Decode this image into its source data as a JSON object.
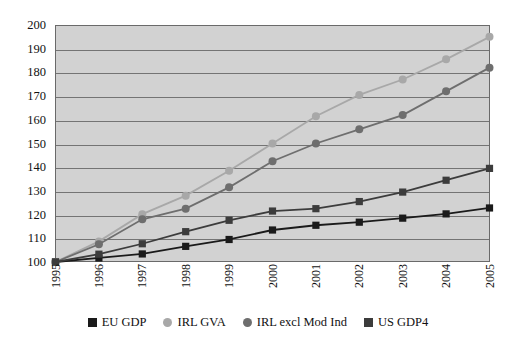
{
  "chart_data": {
    "type": "line",
    "title": "",
    "subtitle": "",
    "xlabel": "",
    "ylabel": "",
    "categories": [
      "1995",
      "1996",
      "1997",
      "1998",
      "1999",
      "2000",
      "2001",
      "2002",
      "2003",
      "2004",
      "2005"
    ],
    "ylim": [
      100,
      200
    ],
    "ytick_values": [
      100,
      110,
      120,
      130,
      140,
      150,
      160,
      170,
      180,
      190,
      200
    ],
    "ytick_labels": [
      "100",
      "110",
      "120",
      "130",
      "140",
      "150",
      "160",
      "170",
      "180",
      "190",
      "200"
    ],
    "grid": true,
    "grid_axis": "y",
    "legend_position": "bottom",
    "plot_background": "#d2d2d2",
    "series": [
      {
        "name": "EU GDP",
        "color": "#1a1a1a",
        "marker": "square",
        "values": [
          100,
          101.7,
          103.4,
          106.6,
          109.5,
          113.5,
          115.5,
          116.8,
          118.5,
          120.3,
          122.8
        ]
      },
      {
        "name": "IRL GVA",
        "color": "#a8a8a8",
        "marker": "circle",
        "values": [
          100,
          108.7,
          120.2,
          128.0,
          138.5,
          150.0,
          161.5,
          170.5,
          177.0,
          185.5,
          195.0
        ]
      },
      {
        "name": "IRL excl Mod Ind",
        "color": "#6e6e6e",
        "marker": "circle",
        "values": [
          100,
          107.5,
          118.0,
          122.5,
          131.5,
          142.5,
          150.0,
          156.0,
          162.0,
          172.0,
          182.0
        ]
      },
      {
        "name": "US GDP4",
        "color": "#3c3c3c",
        "marker": "square",
        "values": [
          100,
          103.3,
          107.7,
          112.8,
          117.6,
          121.5,
          122.5,
          125.5,
          129.5,
          134.5,
          139.5
        ]
      }
    ]
  },
  "legend": {
    "items": [
      {
        "label": "EU GDP",
        "color": "#1a1a1a",
        "marker": "square"
      },
      {
        "label": "IRL GVA",
        "color": "#a8a8a8",
        "marker": "circle"
      },
      {
        "label": "IRL excl Mod Ind",
        "color": "#6e6e6e",
        "marker": "circle"
      },
      {
        "label": "US GDP4",
        "color": "#3c3c3c",
        "marker": "square"
      }
    ]
  }
}
